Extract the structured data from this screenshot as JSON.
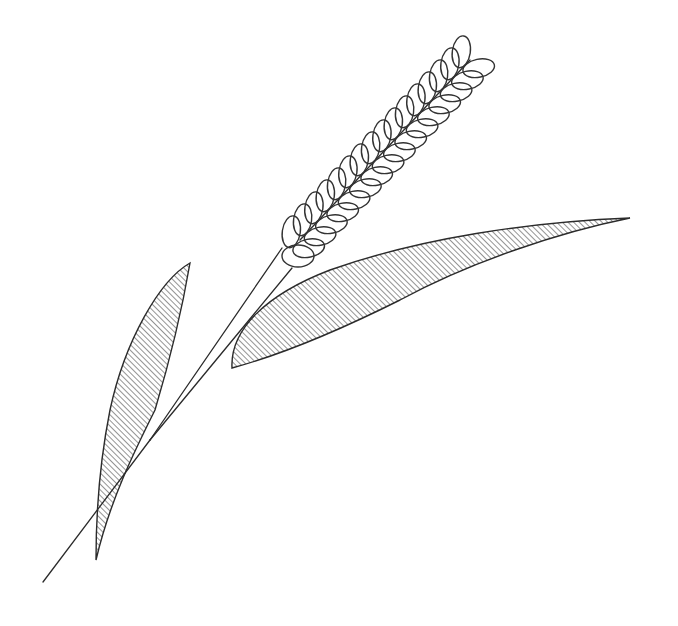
{
  "illustration": {
    "subject": "Wheat stalk line drawing",
    "style": "black ink outline with diagonal hatching on leaves",
    "colors": {
      "background": "#ffffff",
      "ink": "#2b2b2b"
    },
    "parts": [
      {
        "name": "ear",
        "description": "grain head made of overlapping ellipse spikelets in two rows along a central spine",
        "spikelet_count_per_side": 16
      },
      {
        "name": "stem",
        "description": "two converging lines joining into a single stalk"
      },
      {
        "name": "left-leaf",
        "description": "narrow hatched leaf rising to the left of the stem"
      },
      {
        "name": "right-leaf",
        "description": "long hatched leaf extending to the right"
      }
    ]
  }
}
